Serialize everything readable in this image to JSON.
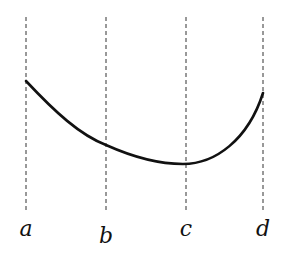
{
  "diagram": {
    "type": "curve-with-vertical-markers",
    "colors": {
      "background": "#ffffff",
      "curve": "#111111",
      "guide": "#333333",
      "label": "#111111"
    },
    "markers": [
      {
        "id": "a",
        "label": "a",
        "x": 26,
        "label_y": 236
      },
      {
        "id": "b",
        "label": "b",
        "x": 106,
        "label_y": 243
      },
      {
        "id": "c",
        "label": "c",
        "x": 186,
        "label_y": 236
      },
      {
        "id": "d",
        "label": "d",
        "x": 263,
        "label_y": 236
      }
    ],
    "guides": {
      "y_top": 17,
      "y_bottom": 213,
      "style": "dashed"
    },
    "curve": {
      "description": "Smooth curve descending from a, passing b, minimum near c, rising steeply to d",
      "points": [
        [
          26,
          81
        ],
        [
          106,
          144
        ],
        [
          183,
          164
        ],
        [
          263,
          93
        ]
      ]
    }
  }
}
